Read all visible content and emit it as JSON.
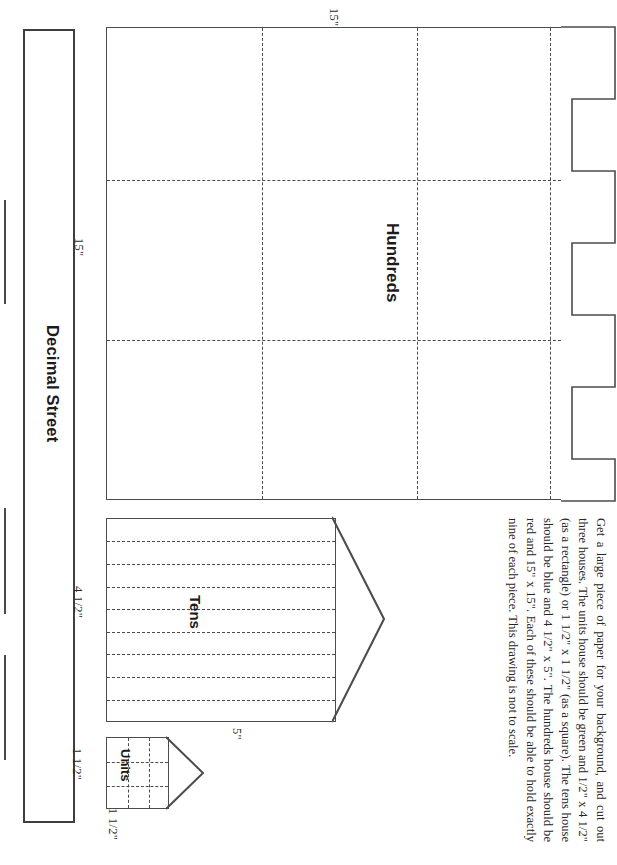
{
  "document": {
    "title": "Decimal Street",
    "orientation": "rotated-90"
  },
  "street": {
    "label": "Decimal Street",
    "dashes": [
      {
        "top": 200,
        "height": 104
      },
      {
        "top": 508,
        "height": 106
      },
      {
        "top": 655,
        "height": 105
      }
    ]
  },
  "houses": [
    {
      "name": "hundreds",
      "label": "Hundreds",
      "width_label": "15\"",
      "height_label": "15\"",
      "grid_cols": 3,
      "grid_rows": 3,
      "roof_steps": 5,
      "color": "red",
      "size": "15\" x 15\""
    },
    {
      "name": "tens",
      "label": "Tens",
      "width_label": "5\"",
      "height_label": "4 1/2\"",
      "grid_cols": 1,
      "grid_rows": 9,
      "color": "blue",
      "size": "4 1/2\" x 5\""
    },
    {
      "name": "units",
      "label": "Units",
      "width_label": "1 1/2\"",
      "height_label": "1 1/2\"",
      "grid_cols": 3,
      "grid_rows": 3,
      "color": "green",
      "size": "1 1/2\" x 1 1/2\""
    }
  ],
  "dimensions": {
    "hundreds_top": "15\"",
    "hundreds_left": "15\"",
    "tens_left": "4 1/2\"",
    "tens_bottom": "5\"",
    "units_left": "1 1/2\"",
    "units_bottom": "1 1/2\""
  },
  "instructions": {
    "text": "Get a large piece of paper for your background, and cut out three houses. The units house should be green and 1/2\" x 4 1/2\" (as a rectangle) or 1 1/2\" x 1 1/2\" (as a square). The tens house should be blue and 4 1/2\" x 5\". The hundreds house should be red and 15\" x 15\". Each of these should be able to hold exactly nine of each piece. This drawing is not to scale."
  },
  "colors": {
    "ink": "#231f20",
    "line": "#4c4c4e",
    "dash": "#4b4b4d",
    "paper": "#ffffff"
  }
}
